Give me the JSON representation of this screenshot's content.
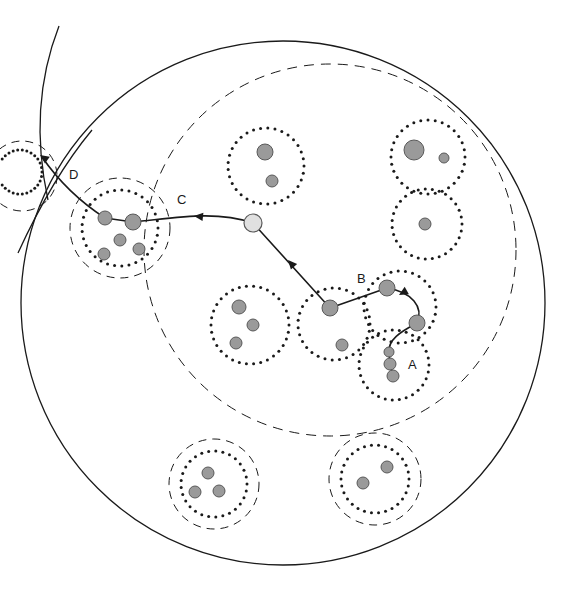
{
  "figure": {
    "width": 577,
    "height": 589,
    "background_color": "#ffffff"
  },
  "style": {
    "line_color": "#1a1a1a",
    "node_fill": "#9a9a9a",
    "node_stroke": "#595959",
    "highlight_node_fill": "#e0e0e0",
    "dotted_ring_color": "#1a1a1a",
    "dashed_ring_color": "#1a1a1a"
  },
  "labels": [
    {
      "name": "label-A",
      "text": "A",
      "x": 408,
      "y": 366
    },
    {
      "name": "label-B",
      "text": "B",
      "x": 357,
      "y": 280
    },
    {
      "name": "label-C",
      "text": "C",
      "x": 177,
      "y": 201
    },
    {
      "name": "label-D",
      "text": "D",
      "x": 69,
      "y": 176
    }
  ],
  "boundaries": [
    {
      "name": "outer-solid-circle",
      "shape": "circle",
      "style": "solid",
      "cx": 283,
      "cy": 303,
      "r": 262
    },
    {
      "name": "inner-dashed-circle",
      "shape": "circle",
      "style": "dashed",
      "cx": 330,
      "cy": 250,
      "r": 186
    },
    {
      "name": "top-left-arc-outer",
      "shape": "arc",
      "style": "solid",
      "path": "M 59 26 C 38 80 35 140 48 200"
    },
    {
      "name": "left-arc-crossing",
      "shape": "arc",
      "style": "solid",
      "path": "M 18 253 C 40 205 62 166 92 130"
    },
    {
      "name": "left-edge-dotted-fragment",
      "shape": "partial-dotted-circle",
      "style": "dotted",
      "cx": 20,
      "cy": 172,
      "r": 22
    },
    {
      "name": "left-edge-dashed-fragment",
      "shape": "partial-dashed-circle",
      "style": "dashed",
      "cx": 22,
      "cy": 176,
      "r": 35
    }
  ],
  "clusters": [
    {
      "name": "cluster-D",
      "label": "D",
      "cx": 120,
      "cy": 228,
      "dotted_r": 38,
      "dashed_r": 50,
      "has_dashed_ring": true,
      "node_count": 5,
      "nodes": [
        {
          "x": 105,
          "y": 218,
          "r": 7
        },
        {
          "x": 133,
          "y": 222,
          "r": 8
        },
        {
          "x": 120,
          "y": 240,
          "r": 6
        },
        {
          "x": 104,
          "y": 254,
          "r": 6
        },
        {
          "x": 139,
          "y": 249,
          "r": 6
        }
      ]
    },
    {
      "name": "cluster-top-middle",
      "label": "",
      "cx": 266,
      "cy": 166,
      "dotted_r": 38,
      "dashed_r": 0,
      "has_dashed_ring": false,
      "node_count": 2,
      "nodes": [
        {
          "x": 265,
          "y": 152,
          "r": 8
        },
        {
          "x": 272,
          "y": 181,
          "r": 6
        }
      ]
    },
    {
      "name": "cluster-top-right",
      "label": "",
      "cx": 428,
      "cy": 157,
      "dotted_r": 37,
      "dashed_r": 0,
      "has_dashed_ring": false,
      "node_count": 2,
      "nodes": [
        {
          "x": 414,
          "y": 150,
          "r": 10
        },
        {
          "x": 444,
          "y": 158,
          "r": 5
        }
      ]
    },
    {
      "name": "cluster-right-middle",
      "label": "",
      "cx": 427,
      "cy": 224,
      "dotted_r": 35,
      "dashed_r": 0,
      "has_dashed_ring": false,
      "node_count": 1,
      "nodes": [
        {
          "x": 425,
          "y": 224,
          "r": 6
        }
      ]
    },
    {
      "name": "cluster-left-middle",
      "label": "",
      "cx": 250,
      "cy": 325,
      "dotted_r": 39,
      "dashed_r": 0,
      "has_dashed_ring": false,
      "node_count": 3,
      "nodes": [
        {
          "x": 239,
          "y": 307,
          "r": 7
        },
        {
          "x": 253,
          "y": 325,
          "r": 6
        },
        {
          "x": 236,
          "y": 343,
          "r": 6
        }
      ]
    },
    {
      "name": "cluster-center-path",
      "label": "",
      "cx": 334,
      "cy": 324,
      "dotted_r": 36,
      "dashed_r": 0,
      "has_dashed_ring": false,
      "node_count": 2,
      "nodes": [
        {
          "x": 330,
          "y": 308,
          "r": 8
        },
        {
          "x": 342,
          "y": 345,
          "r": 6
        }
      ]
    },
    {
      "name": "cluster-B",
      "label": "B",
      "cx": 400,
      "cy": 307,
      "dotted_r": 36,
      "dashed_r": 0,
      "has_dashed_ring": false,
      "node_count": 2,
      "nodes": [
        {
          "x": 387,
          "y": 288,
          "r": 8
        },
        {
          "x": 417,
          "y": 323,
          "r": 8
        }
      ]
    },
    {
      "name": "cluster-A",
      "label": "A",
      "cx": 394,
      "cy": 365,
      "dotted_r": 35,
      "dashed_r": 0,
      "has_dashed_ring": false,
      "node_count": 3,
      "nodes": [
        {
          "x": 389,
          "y": 352,
          "r": 5
        },
        {
          "x": 390,
          "y": 364,
          "r": 6
        },
        {
          "x": 393,
          "y": 376,
          "r": 6
        }
      ]
    },
    {
      "name": "cluster-bottom-left",
      "label": "",
      "cx": 214,
      "cy": 484,
      "dotted_r": 33,
      "dashed_r": 45,
      "has_dashed_ring": true,
      "node_count": 3,
      "nodes": [
        {
          "x": 208,
          "y": 473,
          "r": 6
        },
        {
          "x": 195,
          "y": 492,
          "r": 6
        },
        {
          "x": 219,
          "y": 491,
          "r": 6
        }
      ]
    },
    {
      "name": "cluster-bottom-right",
      "label": "",
      "cx": 375,
      "cy": 479,
      "dotted_r": 34,
      "dashed_r": 46,
      "has_dashed_ring": true,
      "node_count": 2,
      "nodes": [
        {
          "x": 387,
          "y": 467,
          "r": 6
        },
        {
          "x": 363,
          "y": 483,
          "r": 6
        }
      ]
    }
  ],
  "path": {
    "name": "traversal-path",
    "description": "Directed path from cluster A through B, center, C-boundary, to D and beyond",
    "segments": [
      {
        "name": "segment-A-to-B-node",
        "from": "A",
        "to": "B-lower-node",
        "path": "M 393 376 L 390 364 L 389 352 C 388 340 400 332 417 323"
      },
      {
        "name": "segment-B-curve",
        "from": "B-lower-node",
        "to": "B-upper-node",
        "path": "M 417 323 C 424 307 412 292 387 288"
      },
      {
        "name": "segment-B-to-center",
        "from": "B-upper-node",
        "to": "center-node",
        "path": "M 387 288 L 330 308"
      },
      {
        "name": "segment-center-to-white",
        "from": "center-node",
        "to": "white-node",
        "path": "M 330 308 L 253 223"
      },
      {
        "name": "segment-white-to-D",
        "from": "white-node",
        "to": "D-right-node",
        "path": "M 253 223 C 215 210 175 218 133 222"
      },
      {
        "name": "segment-D-inner",
        "from": "D-right-node",
        "to": "D-left-node",
        "path": "M 133 222 L 105 218"
      },
      {
        "name": "segment-D-outward",
        "from": "D-left-node",
        "to": "exit-arrow",
        "path": "M 105 218 C 85 205 62 186 42 157"
      }
    ],
    "arrowheads": [
      {
        "name": "arrowhead-toward-B-upper",
        "x": 399,
        "y": 295,
        "angle": 150
      },
      {
        "name": "arrowhead-toward-white",
        "x": 288,
        "y": 260,
        "angle": 228
      },
      {
        "name": "arrowhead-toward-D",
        "x": 194,
        "y": 216,
        "angle": 186
      },
      {
        "name": "arrowhead-exit-upper-left",
        "x": 40,
        "y": 155,
        "angle": 215
      }
    ],
    "highlight_node": {
      "name": "white-node",
      "x": 253,
      "y": 223,
      "r": 9,
      "fill": "#e0e0e0"
    }
  }
}
